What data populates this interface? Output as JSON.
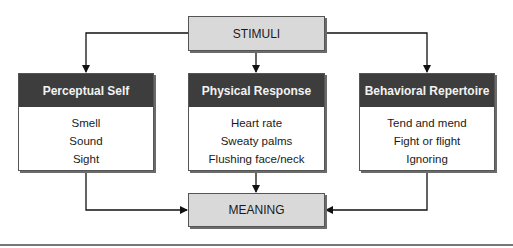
{
  "diagram": {
    "top": {
      "label": "STIMULI"
    },
    "bottom": {
      "label": "MEANING"
    },
    "boxes": [
      {
        "title": "Perceptual Self",
        "items": [
          "Smell",
          "Sound",
          "Sight"
        ]
      },
      {
        "title": "Physical Response",
        "items": [
          "Heart rate",
          "Sweaty palms",
          "Flushing face/neck"
        ]
      },
      {
        "title": "Behavioral Repertoire",
        "items": [
          "Tend and mend",
          "Fight or flight",
          "Ignoring"
        ]
      }
    ],
    "colors": {
      "header": "#3d3d3d",
      "gray_box": "#d9d9d9",
      "line": "#111111"
    }
  }
}
